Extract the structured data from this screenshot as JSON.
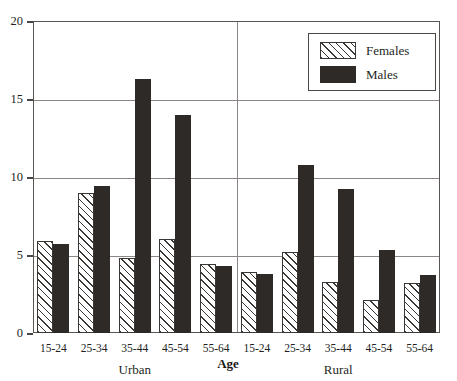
{
  "chart_data": {
    "type": "bar",
    "title": "",
    "xlabel": "Age",
    "ylabel": "",
    "ylim": [
      0,
      20
    ],
    "yticks": [
      0,
      5,
      10,
      15,
      20
    ],
    "grid": true,
    "legend_position": "top-right",
    "panels": [
      {
        "name": "Urban",
        "categories": [
          "15-24",
          "25-34",
          "35-44",
          "45-54",
          "55-64"
        ],
        "series": [
          {
            "name": "Females",
            "values": [
              5.9,
              9.0,
              4.8,
              6.0,
              4.4
            ]
          },
          {
            "name": "Males",
            "values": [
              5.7,
              9.4,
              16.3,
              14.0,
              4.3
            ]
          }
        ]
      },
      {
        "name": "Rural",
        "categories": [
          "15-24",
          "25-34",
          "35-44",
          "45-54",
          "55-64"
        ],
        "series": [
          {
            "name": "Females",
            "values": [
              3.9,
              5.2,
              3.3,
              2.1,
              3.2
            ]
          },
          {
            "name": "Males",
            "values": [
              3.8,
              10.8,
              9.2,
              5.3,
              3.7
            ]
          }
        ]
      }
    ],
    "legend": [
      "Females",
      "Males"
    ],
    "colors": {
      "females": "#ffffff",
      "females_hatch": "#3a3634",
      "males": "#2e2a28",
      "axis": "#595552",
      "grid": "#8c8784"
    }
  }
}
